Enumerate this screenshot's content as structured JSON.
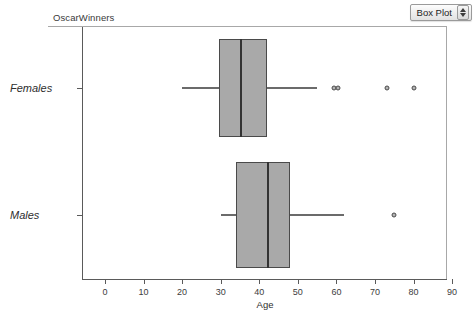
{
  "header": {
    "dataset_title": "OscarWinners",
    "plot_type_label": "Box Plot",
    "stepper_up_icon": "caret-up-icon",
    "stepper_down_icon": "caret-down-icon"
  },
  "chart_data": {
    "type": "box",
    "title": "OscarWinners",
    "xlabel": "Age",
    "ylabel": "",
    "xlim": [
      -2,
      94
    ],
    "x_ticks": [
      0,
      10,
      20,
      30,
      40,
      50,
      60,
      70,
      80,
      90
    ],
    "x_tick_labels": [
      "0",
      "10",
      "20",
      "30",
      "40",
      "50",
      "60",
      "70",
      "80",
      "90"
    ],
    "grid": false,
    "legend": "none",
    "orientation": "horizontal",
    "categories": [
      "Females",
      "Males"
    ],
    "boxes": [
      {
        "name": "Females",
        "whisker_low": 20,
        "q1": 29.5,
        "median": 35,
        "q3": 42,
        "whisker_high": 55,
        "outliers": [
          59.5,
          60.5,
          73,
          80
        ]
      },
      {
        "name": "Males",
        "whisker_low": 30,
        "q1": 34,
        "median": 42,
        "q3": 48,
        "whisker_high": 62,
        "outliers": [
          75
        ]
      }
    ],
    "colors": {
      "box_fill": "#a9a9a9",
      "box_edge": "#4a4a4a",
      "median": "#333333",
      "whisker": "#6b6b6b",
      "outlier_fill": "#b4b4b4",
      "axis": "#5a5a5a"
    }
  }
}
